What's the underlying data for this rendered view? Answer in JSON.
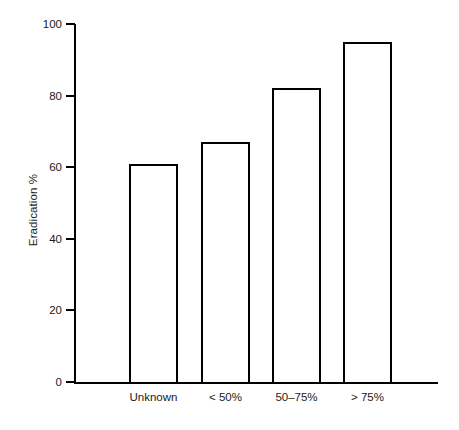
{
  "chart_data": {
    "type": "bar",
    "title": "",
    "subtitle": "",
    "xlabel": "",
    "ylabel": "Eradication %",
    "categories": [
      "Unknown",
      "< 50%",
      "50–75%",
      "> 75%"
    ],
    "values": [
      61,
      67,
      82,
      95
    ],
    "series": [
      {
        "name": "Eradication %",
        "values": [
          61,
          67,
          82,
          95
        ]
      }
    ],
    "ylim": [
      0,
      100
    ],
    "ytick_labels": [
      "0",
      "20",
      "40",
      "60",
      "80",
      "100"
    ],
    "ytick_values": [
      0,
      20,
      40,
      60,
      80,
      100
    ],
    "grid": false,
    "legend": false,
    "legend_position": "none",
    "bar_fill_color": "#ffffff",
    "bar_edge_color": "#000000",
    "axis_color": "#000000",
    "background_color": "#ffffff",
    "annotations": []
  }
}
